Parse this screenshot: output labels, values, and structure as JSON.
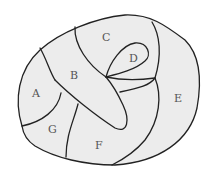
{
  "diagram": {
    "type": "map-regions",
    "fill_color": "#ececec",
    "stroke_color": "#222222",
    "label_color": "#555555",
    "regions": [
      {
        "id": "A",
        "label": "A",
        "x": 35,
        "y": 97
      },
      {
        "id": "B",
        "label": "B",
        "x": 73,
        "y": 79
      },
      {
        "id": "C",
        "label": "C",
        "x": 105,
        "y": 41
      },
      {
        "id": "D",
        "label": "D",
        "x": 133,
        "y": 62
      },
      {
        "id": "E",
        "label": "E",
        "x": 177,
        "y": 102
      },
      {
        "id": "F",
        "label": "F",
        "x": 98,
        "y": 149
      },
      {
        "id": "G",
        "label": "G",
        "x": 52,
        "y": 133
      }
    ]
  }
}
